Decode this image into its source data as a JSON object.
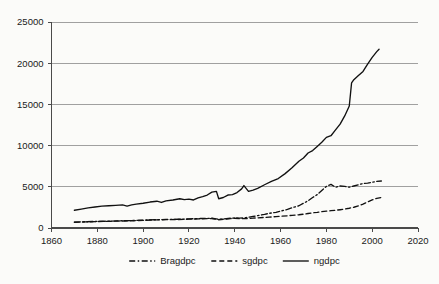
{
  "chart_data": {
    "type": "line",
    "title": "",
    "subtitle": "",
    "xlabel": "",
    "ylabel": "",
    "xlim": [
      1860,
      2020
    ],
    "ylim": [
      0,
      25000
    ],
    "xticks": [
      1860,
      1880,
      1900,
      1920,
      1940,
      1960,
      1980,
      2000,
      2020
    ],
    "yticks": [
      0,
      5000,
      10000,
      15000,
      20000,
      25000
    ],
    "xtick_labels": [
      "1860",
      "1880",
      "1900",
      "1920",
      "1940",
      "1960",
      "1980",
      "2000",
      "2020"
    ],
    "ytick_labels": [
      "0",
      "5000",
      "10000",
      "15000",
      "20000",
      "25000"
    ],
    "grid": "horizontal",
    "legend_position": "bottom",
    "line_color": "#111111",
    "grid_color": "#8a8a8a",
    "axis_color": "#4a4a4a",
    "background_color": "#fbfbf9",
    "series": [
      {
        "name": "Bragdpc",
        "style": "dashdot",
        "legend_label": "Bragdpc",
        "x": [
          1870,
          1875,
          1880,
          1885,
          1890,
          1895,
          1900,
          1905,
          1910,
          1915,
          1920,
          1925,
          1930,
          1933,
          1935,
          1938,
          1940,
          1942,
          1945,
          1948,
          1950,
          1953,
          1955,
          1958,
          1960,
          1963,
          1965,
          1968,
          1970,
          1972,
          1974,
          1976,
          1978,
          1980,
          1982,
          1984,
          1986,
          1988,
          1990,
          1992,
          1994,
          1996,
          1998,
          2000,
          2002,
          2004
        ],
        "y": [
          720,
          760,
          800,
          830,
          870,
          900,
          950,
          1000,
          1040,
          1060,
          1100,
          1150,
          1180,
          1050,
          1100,
          1180,
          1220,
          1200,
          1260,
          1400,
          1500,
          1650,
          1780,
          1900,
          2050,
          2250,
          2450,
          2700,
          3000,
          3300,
          3700,
          4050,
          4550,
          5050,
          5300,
          4950,
          5100,
          5050,
          4950,
          5100,
          5250,
          5400,
          5450,
          5550,
          5650,
          5700
        ]
      },
      {
        "name": "sgdpc",
        "style": "dashed",
        "legend_label": "sgdpc",
        "x": [
          1870,
          1875,
          1880,
          1885,
          1890,
          1895,
          1900,
          1905,
          1910,
          1915,
          1920,
          1925,
          1930,
          1933,
          1935,
          1938,
          1940,
          1942,
          1945,
          1948,
          1950,
          1953,
          1955,
          1958,
          1960,
          1963,
          1965,
          1968,
          1970,
          1972,
          1974,
          1976,
          1978,
          1980,
          1982,
          1984,
          1986,
          1988,
          1990,
          1992,
          1994,
          1996,
          1998,
          2000,
          2002,
          2004
        ],
        "y": [
          700,
          740,
          780,
          810,
          850,
          880,
          930,
          980,
          1010,
          1030,
          1070,
          1120,
          1150,
          1000,
          1060,
          1140,
          1180,
          1140,
          1150,
          1190,
          1230,
          1280,
          1320,
          1380,
          1420,
          1480,
          1540,
          1610,
          1680,
          1760,
          1840,
          1900,
          1980,
          2050,
          2100,
          2150,
          2220,
          2300,
          2400,
          2520,
          2680,
          2900,
          3150,
          3400,
          3600,
          3700
        ]
      },
      {
        "name": "ngdpc",
        "style": "solid",
        "legend_label": "ngdpc",
        "x": [
          1870,
          1873,
          1876,
          1879,
          1882,
          1885,
          1888,
          1891,
          1893,
          1895,
          1897,
          1900,
          1903,
          1906,
          1908,
          1910,
          1913,
          1916,
          1918,
          1920,
          1922,
          1924,
          1926,
          1928,
          1930,
          1932,
          1933,
          1935,
          1937,
          1939,
          1941,
          1943,
          1944,
          1946,
          1948,
          1950,
          1953,
          1956,
          1959,
          1962,
          1965,
          1968,
          1970,
          1972,
          1974,
          1976,
          1978,
          1980,
          1982,
          1984,
          1986,
          1988,
          1990,
          1991,
          1992,
          1994,
          1996,
          1998,
          2000,
          2002,
          2003
        ],
        "y": [
          2150,
          2300,
          2450,
          2550,
          2650,
          2700,
          2750,
          2800,
          2650,
          2800,
          2900,
          3000,
          3150,
          3250,
          3100,
          3300,
          3400,
          3550,
          3450,
          3500,
          3400,
          3650,
          3800,
          4000,
          4350,
          4450,
          3550,
          3700,
          4000,
          4050,
          4300,
          4750,
          5150,
          4450,
          4600,
          4800,
          5250,
          5650,
          6000,
          6600,
          7300,
          8100,
          8500,
          9100,
          9400,
          9900,
          10400,
          11000,
          11200,
          11900,
          12600,
          13600,
          14800,
          17600,
          18000,
          18500,
          19000,
          19900,
          20700,
          21400,
          21700
        ]
      }
    ]
  },
  "legend": {
    "entries": [
      {
        "label": "Bragdpc",
        "style": "dashdot"
      },
      {
        "label": "sgdpc",
        "style": "dashed"
      },
      {
        "label": "ngdpc",
        "style": "solid"
      }
    ]
  }
}
